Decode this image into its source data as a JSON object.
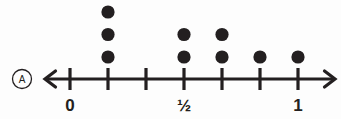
{
  "figure": {
    "label_badge": "A",
    "background_color": "#fdfdfd",
    "ink_color": "#231f20"
  },
  "chart_data": {
    "type": "scatter",
    "plot_variant": "dot-plot",
    "title": "",
    "subtitle": "",
    "xlabel": "",
    "ylabel": "",
    "grid": false,
    "legend_position": "none",
    "axis": {
      "orientation": "horizontal",
      "left_arrow": true,
      "right_arrow": true,
      "xlim": [
        -0.125,
        0.9375
      ],
      "tick_interval": 0.125
    },
    "tick_positions": [
      0,
      0.125,
      0.25,
      0.375,
      0.5,
      0.625,
      0.75
    ],
    "tick_labels": [
      "0",
      "",
      "",
      "",
      "½",
      "",
      "1"
    ],
    "labeled_ticks": [
      {
        "value": 0,
        "label": "0"
      },
      {
        "value": 0.5,
        "label": "½"
      },
      {
        "value": 0.75,
        "label": "1"
      }
    ],
    "categories": [
      "0",
      "1/8",
      "1/4",
      "3/8",
      "1/2",
      "5/8",
      "3/4"
    ],
    "x": [
      0,
      0.125,
      0.25,
      0.375,
      0.5,
      0.625,
      0.75
    ],
    "values": [
      0,
      3,
      0,
      2,
      2,
      1,
      1
    ],
    "points": [
      {
        "x": 0.125,
        "count": 3
      },
      {
        "x": 0.375,
        "count": 2
      },
      {
        "x": 0.5,
        "count": 2
      },
      {
        "x": 0.625,
        "count": 1
      },
      {
        "x": 0.75,
        "count": 1
      }
    ],
    "total_dots": 9,
    "ylim": [
      0,
      3
    ],
    "dot_color": "#231f20"
  }
}
